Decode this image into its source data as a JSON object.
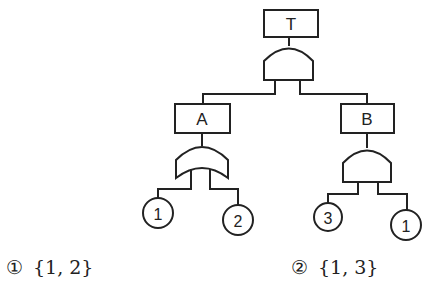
{
  "diagram": {
    "type": "fault-tree",
    "top_event": {
      "label": "T",
      "gate": "AND"
    },
    "intermediate_events": [
      {
        "label": "A",
        "gate": "OR",
        "inputs": [
          "1",
          "2"
        ]
      },
      {
        "label": "B",
        "gate": "AND",
        "inputs": [
          "3",
          "1"
        ]
      }
    ],
    "basic_events": [
      "1",
      "2",
      "3",
      "1"
    ]
  },
  "options": [
    {
      "marker": "①",
      "text": "{1,  2}"
    },
    {
      "marker": "②",
      "text": "{1,  3}"
    }
  ]
}
